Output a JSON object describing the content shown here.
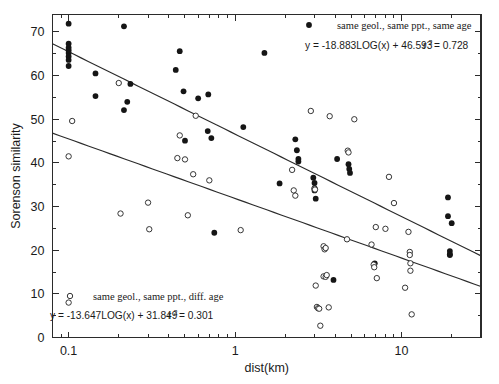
{
  "chart_data": {
    "type": "scatter",
    "title": "",
    "xlabel": "dist(km)",
    "ylabel": "Sorenson similarity",
    "xscale": "log",
    "yscale": "linear",
    "xlim": [
      0.08,
      30
    ],
    "ylim": [
      0,
      74
    ],
    "xticks": [
      0.1,
      1,
      10
    ],
    "xtick_labels": [
      "0.1",
      "1",
      "10"
    ],
    "yticks": [
      0,
      10,
      20,
      30,
      40,
      50,
      60,
      70
    ],
    "ytick_labels": [
      "0",
      "10",
      "20",
      "30",
      "40",
      "50",
      "60",
      "70"
    ],
    "yminor_step": 5,
    "grid": false,
    "legend_position": "top-right and bottom-left",
    "series": [
      {
        "name": "same geol., same ppt., same age",
        "marker": "filled-circle",
        "color": "#151515",
        "equation": "y =  -18.883LOG(x) + 46.593",
        "r_squared_label": "r",
        "r_squared_exp": "2",
        "r_squared_value": "= 0.728",
        "fit": {
          "slope": -18.883,
          "intercept": 46.593,
          "r2": 0.728
        },
        "points": [
          [
            0.1,
            71.9
          ],
          [
            0.1,
            67.3
          ],
          [
            0.1,
            66.4
          ],
          [
            0.1,
            65.8
          ],
          [
            0.1,
            65.2
          ],
          [
            0.1,
            64.4
          ],
          [
            0.1,
            63.6
          ],
          [
            0.1,
            62.2
          ],
          [
            0.145,
            60.5
          ],
          [
            0.145,
            55.3
          ],
          [
            0.215,
            71.3
          ],
          [
            0.215,
            52.1
          ],
          [
            0.225,
            54.0
          ],
          [
            0.235,
            58.1
          ],
          [
            0.44,
            61.3
          ],
          [
            0.465,
            65.6
          ],
          [
            0.49,
            56.4
          ],
          [
            0.5,
            45.1
          ],
          [
            0.6,
            54.8
          ],
          [
            0.69,
            55.7
          ],
          [
            0.685,
            47.3
          ],
          [
            0.72,
            45.7
          ],
          [
            0.75,
            24.0
          ],
          [
            1.12,
            48.2
          ],
          [
            1.5,
            65.2
          ],
          [
            1.85,
            35.3
          ],
          [
            2.3,
            45.4
          ],
          [
            2.35,
            42.9
          ],
          [
            2.4,
            40.9
          ],
          [
            2.4,
            40.3
          ],
          [
            2.95,
            36.6
          ],
          [
            3.0,
            35.4
          ],
          [
            3.0,
            34.2
          ],
          [
            3.0,
            33.7
          ],
          [
            3.05,
            31.8
          ],
          [
            3.9,
            13.2
          ],
          [
            4.1,
            40.9
          ],
          [
            4.8,
            39.7
          ],
          [
            4.85,
            38.6
          ],
          [
            4.9,
            37.7
          ],
          [
            6.9,
            17.0
          ],
          [
            19.0,
            32.1
          ],
          [
            19.0,
            27.8
          ],
          [
            20.0,
            26.2
          ],
          [
            19.5,
            19.8
          ],
          [
            19.5,
            19.1
          ],
          [
            19.5,
            18.9
          ]
        ]
      },
      {
        "name": "same geol., same ppt., diff. age",
        "marker": "open-circle",
        "color": "#2b2b2b",
        "equation": "y =  -13.647LOG(x) + 31.849",
        "r_squared_label": "r",
        "r_squared_exp": "2",
        "r_squared_value": "= 0.301",
        "fit": {
          "slope": -13.647,
          "intercept": 31.849,
          "r2": 0.301
        },
        "points": [
          [
            0.105,
            49.6
          ],
          [
            0.1,
            41.5
          ],
          [
            0.1,
            8.0
          ],
          [
            0.2,
            58.3
          ],
          [
            0.205,
            28.4
          ],
          [
            0.3,
            30.9
          ],
          [
            0.305,
            24.8
          ],
          [
            0.45,
            41.1
          ],
          [
            0.465,
            46.3
          ],
          [
            0.5,
            40.8
          ],
          [
            0.52,
            28.0
          ],
          [
            0.56,
            37.4
          ],
          [
            0.58,
            50.8
          ],
          [
            0.7,
            36.0
          ],
          [
            1.08,
            24.6
          ],
          [
            2.2,
            38.4
          ],
          [
            2.25,
            33.7
          ],
          [
            2.3,
            32.5
          ],
          [
            2.85,
            51.9
          ],
          [
            3.0,
            34.1
          ],
          [
            3.02,
            33.9
          ],
          [
            3.05,
            11.9
          ],
          [
            3.1,
            7.0
          ],
          [
            3.15,
            6.7
          ],
          [
            3.2,
            6.6
          ],
          [
            3.25,
            2.7
          ],
          [
            3.4,
            20.9
          ],
          [
            3.45,
            20.2
          ],
          [
            3.5,
            20.5
          ],
          [
            3.4,
            14.0
          ],
          [
            3.5,
            13.9
          ],
          [
            3.55,
            14.3
          ],
          [
            3.65,
            6.9
          ],
          [
            3.7,
            50.7
          ],
          [
            4.7,
            22.5
          ],
          [
            4.75,
            42.8
          ],
          [
            4.8,
            42.4
          ],
          [
            5.2,
            50.0
          ],
          [
            6.6,
            21.3
          ],
          [
            6.8,
            16.7
          ],
          [
            6.85,
            16.1
          ],
          [
            7.0,
            25.3
          ],
          [
            7.1,
            13.6
          ],
          [
            8.0,
            24.9
          ],
          [
            8.4,
            36.8
          ],
          [
            9.0,
            30.8
          ],
          [
            10.5,
            11.4
          ],
          [
            11.0,
            24.2
          ],
          [
            11.2,
            19.6
          ],
          [
            11.2,
            18.9
          ],
          [
            11.3,
            17.0
          ],
          [
            11.3,
            15.3
          ],
          [
            11.5,
            5.3
          ]
        ]
      }
    ]
  },
  "legend": {
    "top": {
      "label": "same geol., same ppt., same age",
      "marker": "filled-circle-marker"
    },
    "bottom": {
      "label": "same geol., same ppt., diff. age",
      "marker": "open-circle-marker"
    }
  },
  "axes": {
    "x_title": "dist(km)",
    "y_title": "Sorenson similarity"
  }
}
